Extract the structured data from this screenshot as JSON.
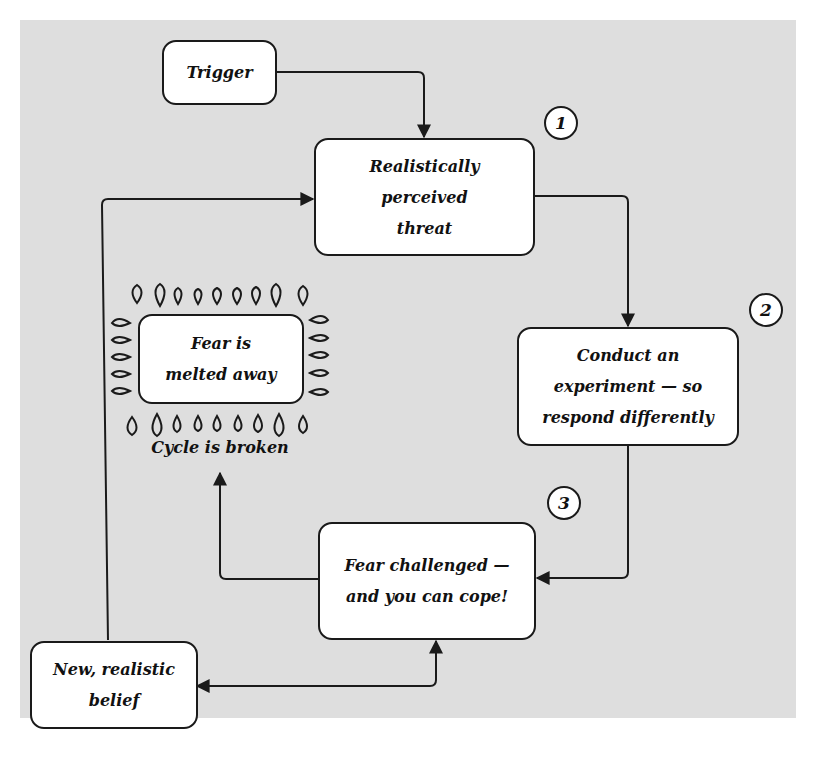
{
  "diagram": {
    "colors": {
      "background": "#dedede",
      "box_fill": "#ffffff",
      "stroke": "#1a1a1a"
    },
    "nodes": {
      "trigger": {
        "lines": [
          "Trigger"
        ]
      },
      "threat": {
        "lines": [
          "Realistically",
          "perceived",
          "threat"
        ]
      },
      "experiment": {
        "lines": [
          "Conduct an",
          "experiment — so",
          "respond differently"
        ]
      },
      "challenged": {
        "lines": [
          "Fear challenged —",
          "and you can cope!"
        ]
      },
      "belief": {
        "lines": [
          "New, realistic",
          "belief"
        ]
      },
      "melted": {
        "lines": [
          "Fear is",
          "melted away"
        ]
      }
    },
    "badges": {
      "one": "1",
      "two": "2",
      "three": "3"
    },
    "caption": "Cycle is broken",
    "edges": [
      {
        "from": "trigger",
        "to": "threat"
      },
      {
        "from": "threat",
        "to": "experiment"
      },
      {
        "from": "experiment",
        "to": "challenged"
      },
      {
        "from": "challenged",
        "to": "melted"
      },
      {
        "from": "challenged",
        "to": "belief",
        "bidirectional": true
      },
      {
        "from": "belief",
        "to": "threat"
      }
    ]
  }
}
